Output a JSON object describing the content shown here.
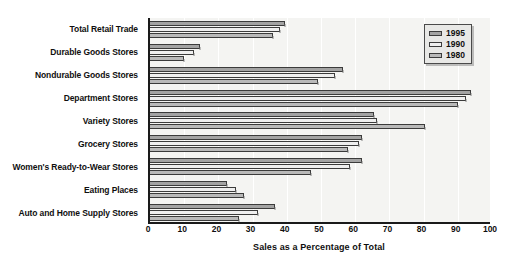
{
  "chart_data": {
    "type": "bar",
    "orientation": "horizontal",
    "title": "",
    "xlabel": "Sales as a Percentage of Total",
    "ylabel": "",
    "xlim": [
      0,
      100
    ],
    "xticks": [
      "0",
      "10",
      "20",
      "30",
      "40",
      "50",
      "60",
      "70",
      "80",
      "90",
      "100"
    ],
    "grid": "vertical",
    "legend_position": "top-right",
    "categories": [
      "Total Retail Trade",
      "Durable Goods Stores",
      "Nondurable Goods Stores",
      "Department Stores",
      "Variety Stores",
      "Grocery Stores",
      "Women's Ready-to-Wear Stores",
      "Eating Places",
      "Auto and Home Supply Stores"
    ],
    "series": [
      {
        "name": "1995",
        "color": "#a3a3a3",
        "values": [
          39.5,
          14.5,
          56.5,
          94.0,
          65.5,
          62.0,
          62.0,
          22.5,
          36.5
        ]
      },
      {
        "name": "1990",
        "color": "#efefef",
        "values": [
          38.0,
          13.0,
          54.0,
          92.5,
          66.5,
          61.0,
          58.5,
          25.0,
          31.5
        ]
      },
      {
        "name": "1980",
        "color": "#b9b9b9",
        "values": [
          36.0,
          10.0,
          49.0,
          90.0,
          80.5,
          58.0,
          47.0,
          27.5,
          26.0
        ]
      }
    ]
  },
  "legend": {
    "items": [
      {
        "label": "1995",
        "swatch": "s1995"
      },
      {
        "label": "1990",
        "swatch": "s1990"
      },
      {
        "label": "1980",
        "swatch": "s1980"
      }
    ]
  },
  "colors": {
    "plot_background": "#f4f4f2",
    "axis": "#1a1a1a",
    "gridline": "#ffffff",
    "bar_outline": "#3b3b3b",
    "legend_background": "#e8e8e6",
    "text": "#0f0f0f"
  }
}
